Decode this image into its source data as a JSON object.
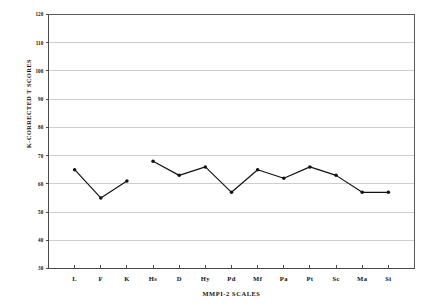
{
  "chart_data": {
    "type": "line",
    "title": "",
    "xlabel": "MMPI-2 SCALES",
    "ylabel": "K-CORRECTED T SCORES",
    "categories": [
      "L",
      "F",
      "K",
      "Hs",
      "D",
      "Hy",
      "Pd",
      "Mf",
      "Pa",
      "Pt",
      "Sc",
      "Ma",
      "Si"
    ],
    "values": [
      65,
      55,
      61,
      68,
      63,
      66,
      57,
      65,
      62,
      66,
      63,
      57,
      57
    ],
    "series": [
      {
        "name": "K-Corrected T Score Profile",
        "values": [
          65,
          55,
          61,
          68,
          63,
          66,
          57,
          65,
          62,
          66,
          63,
          57,
          57
        ]
      }
    ],
    "ylim": [
      30,
      120
    ],
    "yticks": [
      30,
      40,
      50,
      60,
      70,
      80,
      90,
      100,
      110,
      120
    ],
    "ytick_labels": [
      "30",
      "40",
      "50",
      "60",
      "70",
      "80",
      "90",
      "100",
      "110",
      "120"
    ],
    "xtick_labels": [
      "L",
      "F",
      "K",
      "Hs",
      "D",
      "Hy",
      "Pd",
      "Mf",
      "Pa",
      "Pt",
      "Sc",
      "Ma",
      "Si"
    ],
    "grid": true,
    "grid_axis": "y",
    "legend": false,
    "legend_position": "none",
    "marker": "filled-circle",
    "line_color": "#111111",
    "grid_color": "#b8b8b8",
    "axis_color": "#5a5a5a",
    "background_color": "#ffffff",
    "gap_between_validity_and_clinical": true
  },
  "axis": {
    "y_title": "K-CORRECTED T SCORES",
    "x_title": "MMPI-2 SCALES"
  }
}
